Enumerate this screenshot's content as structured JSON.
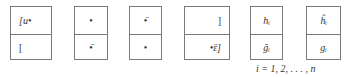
{
  "diagram": {
    "boxes": [
      {
        "top": "[u•",
        "bottom": "["
      },
      {
        "top": "•",
        "bottom": "•̈"
      },
      {
        "top": "•̈",
        "bottom": "•"
      },
      {
        "top": "]",
        "bottom": "•̈ε]"
      },
      {
        "top": "hᵢ",
        "bottom": "ğᵢ"
      },
      {
        "top": "ĥᵢ",
        "bottom": "gᵢ"
      }
    ],
    "caption": "i = 1, 2, . . . , n"
  }
}
